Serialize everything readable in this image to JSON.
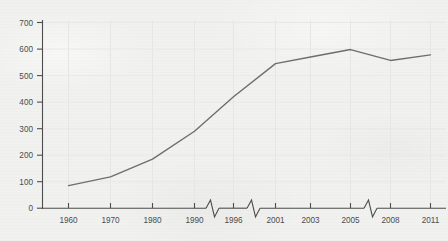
{
  "chart_data": {
    "type": "line",
    "title": "",
    "subtitle": "",
    "xlabel": "",
    "ylabel": "",
    "x": [
      1960,
      1970,
      1980,
      1990,
      1996,
      2001,
      2003,
      2005,
      2008,
      2011
    ],
    "values": [
      85,
      118,
      185,
      290,
      420,
      545,
      570,
      598,
      557,
      578
    ],
    "series": [
      {
        "name": "series-1",
        "values": [
          85,
          118,
          185,
          290,
          420,
          545,
          570,
          598,
          557,
          578
        ]
      }
    ],
    "x_tick_labels": [
      "1960",
      "1970",
      "1980",
      "1990",
      "1996",
      "2001",
      "2003",
      "2005",
      "2008",
      "2011"
    ],
    "y_tick_labels": [
      "0",
      "100",
      "200",
      "300",
      "400",
      "500",
      "600",
      "700"
    ],
    "y_ticks": [
      0,
      100,
      200,
      300,
      400,
      500,
      600,
      700
    ],
    "ylim": [
      0,
      700
    ],
    "grid": true,
    "legend": "none",
    "axis_breaks": [
      {
        "between": [
          "1990",
          "1996"
        ]
      },
      {
        "between": [
          "1996",
          "2001"
        ]
      },
      {
        "between": [
          "2005",
          "2008"
        ]
      }
    ],
    "colors": {
      "line": "#6e6e6e",
      "axis": "#4d4d4d",
      "grid": "#e6e6e4",
      "background": "#f1f1ef",
      "tick_text": "#4c4c4c"
    }
  }
}
